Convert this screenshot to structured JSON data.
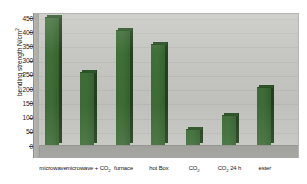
{
  "chart_data": {
    "type": "bar",
    "title": "",
    "xlabel": "",
    "ylabel": "bending strength N/cm²",
    "ylim": [
      0,
      450
    ],
    "ytick_values": [
      450,
      400,
      350,
      300,
      250,
      200,
      150,
      100,
      50,
      0
    ],
    "ytick_labels": [
      "450",
      "400",
      "350",
      "300",
      "250",
      "200",
      "150",
      "100",
      "50",
      "0"
    ],
    "grid": true,
    "legend": "none",
    "categories": [
      "microwave",
      "microwave + CO2",
      "furnace",
      "hot Box",
      "CO2",
      "CO2 24 h",
      "ester"
    ],
    "values": [
      450,
      255,
      405,
      355,
      55,
      105,
      205
    ],
    "series": [
      {
        "name": "bending strength",
        "values": [
          450,
          255,
          405,
          355,
          55,
          105,
          205
        ]
      }
    ],
    "colors": {
      "bar_face": "#3d6b37",
      "bar_side": "#24401f",
      "bar_top": "#2e5428",
      "plot_background": "#c9c9c5",
      "floor": "#9b9b97",
      "gridline": "#bdbdb9",
      "text": "#151515"
    }
  },
  "axis": {
    "y_title_main": "bending strength N/cm",
    "y_title_exponent": "2"
  },
  "categories_display": [
    {
      "text": "microwave",
      "sub": ""
    },
    {
      "text": "microwave + CO",
      "sub": "2"
    },
    {
      "text": "furnace",
      "sub": ""
    },
    {
      "text": "hot Box",
      "sub": ""
    },
    {
      "text": "CO",
      "sub": "2"
    },
    {
      "text": "CO",
      "sub": "2",
      "suffix": " 24 h"
    },
    {
      "text": "ester",
      "sub": ""
    }
  ]
}
